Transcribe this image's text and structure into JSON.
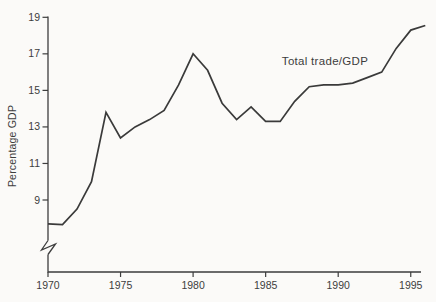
{
  "figure": {
    "background": "#fbfaf8",
    "ink_color": "#3d3d3d",
    "line_color": "#3a3a3a"
  },
  "chart_data": {
    "type": "line",
    "title": "",
    "series_label": "Total trade/GDP",
    "xlabel": "",
    "ylabel": "Percentage GDP",
    "x": [
      1970,
      1971,
      1972,
      1973,
      1974,
      1975,
      1976,
      1977,
      1978,
      1979,
      1980,
      1981,
      1982,
      1983,
      1984,
      1985,
      1986,
      1987,
      1988,
      1989,
      1990,
      1991,
      1992,
      1993,
      1994,
      1995,
      1996
    ],
    "values": [
      7.7,
      7.65,
      8.5,
      10.0,
      13.8,
      12.4,
      13.0,
      13.4,
      13.9,
      15.3,
      17.0,
      16.1,
      14.3,
      13.4,
      14.1,
      13.3,
      13.3,
      14.4,
      15.2,
      15.3,
      15.3,
      15.4,
      15.7,
      16.0,
      17.3,
      18.3,
      18.55
    ],
    "y_ticks": [
      19,
      17,
      15,
      13,
      11,
      9
    ],
    "x_ticks": [
      1970,
      1975,
      1980,
      1985,
      1990,
      1995
    ],
    "ylim_shown": [
      7.2,
      19
    ],
    "xlim": [
      1970,
      1996
    ],
    "y_axis_break": true,
    "grid": false,
    "legend_position": "inline-annotation"
  }
}
